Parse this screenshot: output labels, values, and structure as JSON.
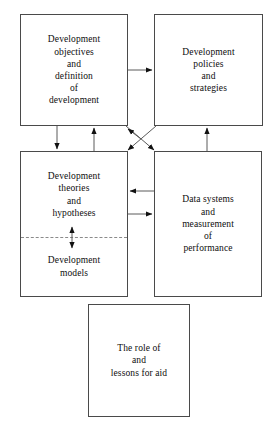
{
  "diagram": {
    "background_color": "#ffffff",
    "line_color": "#5a5a5a",
    "box_border_color": "#4a4a4a",
    "text_color": "#0d0d0d",
    "boxes": [
      {
        "id": "development-objectives",
        "text": "Development\nobjectives\nand\ndefinition\nof\ndevelopment"
      },
      {
        "id": "development-policies",
        "text": "Development\npolicies\nand\nstrategies"
      },
      {
        "id": "development-theories",
        "text": "Development\ntheories\nand\nhypotheses"
      },
      {
        "id": "development-models",
        "text": "Development\nmodels"
      },
      {
        "id": "data-systems",
        "text": "Data systems\nand\nmeasurement\nof\nperformance"
      },
      {
        "id": "role-of-aid",
        "text": "The role of\nand\nlessons for aid"
      }
    ]
  }
}
